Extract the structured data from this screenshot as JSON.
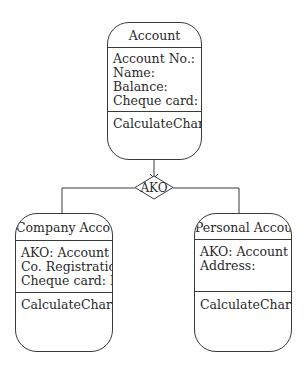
{
  "diagram": {
    "type": "class-inheritance",
    "relationship": {
      "label": "AKO",
      "shape": "diamond"
    },
    "classes": [
      {
        "id": "account",
        "name": "Account",
        "attributes": [
          "Account No.:",
          "Name:",
          "Balance:",
          "Cheque card:"
        ],
        "operations": [
          "CalculateCharges"
        ]
      },
      {
        "id": "company-account",
        "name": "Company Account",
        "attributes": [
          "AKO: Account",
          "Co. Registration:",
          "Cheque card: No"
        ],
        "operations": [
          "CalculateCharges"
        ]
      },
      {
        "id": "personal-account",
        "name": "Personal Account",
        "attributes": [
          "AKO: Account",
          "Address:"
        ],
        "operations": [
          "CalculateCharges"
        ]
      }
    ]
  },
  "colors": {
    "line": "#3a3a3a",
    "text": "#2a2a2a",
    "background": "#ffffff"
  }
}
